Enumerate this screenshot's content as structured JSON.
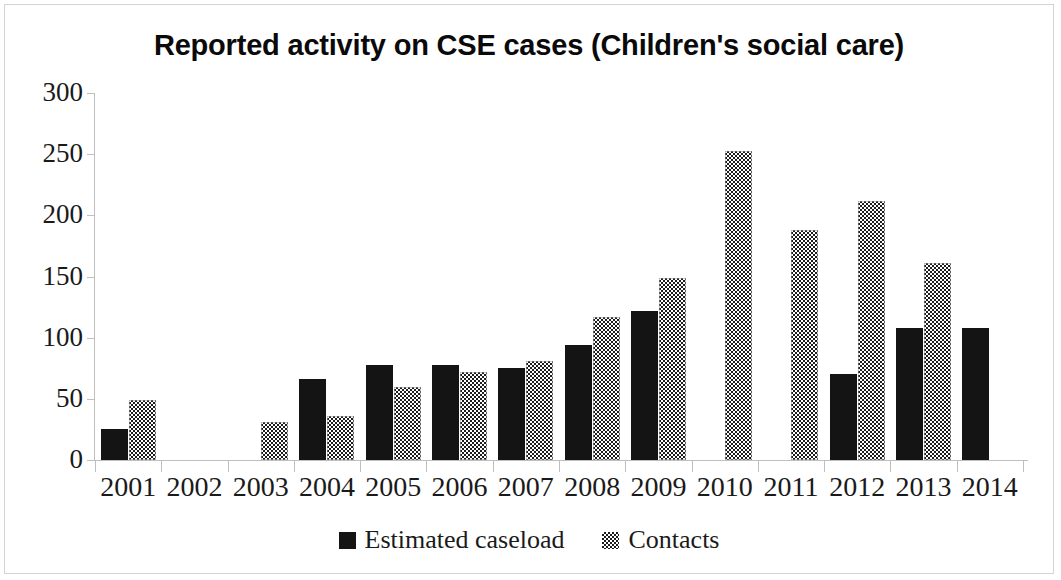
{
  "chart_data": {
    "type": "bar",
    "title": "Reported activity on CSE cases (Children's social care)",
    "xlabel": "",
    "ylabel": "",
    "ylim": [
      0,
      300
    ],
    "yticks": [
      0,
      50,
      100,
      150,
      200,
      250,
      300
    ],
    "grid": false,
    "legend_position": "bottom",
    "categories": [
      "2001",
      "2002",
      "2003",
      "2004",
      "2005",
      "2006",
      "2007",
      "2008",
      "2009",
      "2010",
      "2011",
      "2012",
      "2013",
      "2014"
    ],
    "series": [
      {
        "name": "Estimated caseload",
        "color": "#141414",
        "fill": "solid",
        "values": [
          25,
          null,
          null,
          66,
          78,
          78,
          75,
          94,
          122,
          null,
          null,
          70,
          108,
          108
        ]
      },
      {
        "name": "Contacts",
        "color": "#1c1c1c",
        "fill": "checkerboard",
        "values": [
          49,
          null,
          31,
          36,
          60,
          72,
          81,
          117,
          149,
          253,
          188,
          212,
          161,
          null
        ]
      }
    ]
  },
  "figure": {
    "border_color": "#d4d4d4",
    "background": "#ffffff",
    "axis_color": "#bfbfbf",
    "text_color": "#1a1a1a"
  }
}
